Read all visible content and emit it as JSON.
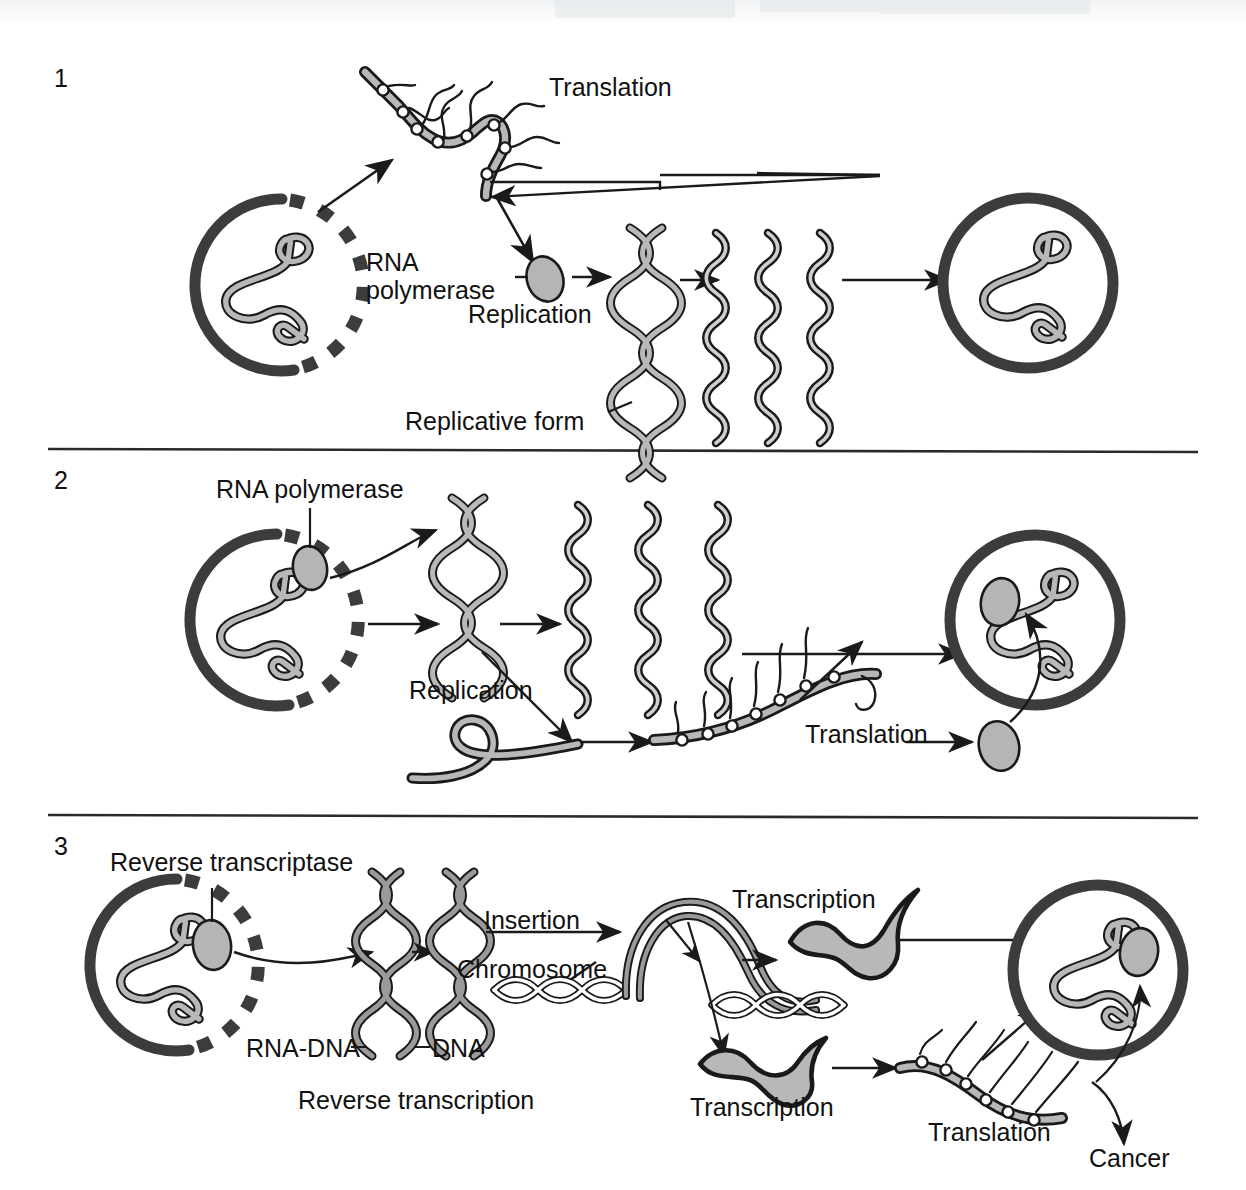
{
  "figure": {
    "type": "biology-diagram",
    "background_color": "#ffffff",
    "ink_color": "#1a1a1a",
    "strand_fill": "#b8b8b8",
    "capsid_color": "#3c3c3c",
    "enzyme_fill": "#b5b5b5"
  },
  "panels": [
    {
      "number": "1",
      "name": "positive-sense-rna-virus",
      "labels": [
        {
          "id": "p1-translation",
          "text": "Translation"
        },
        {
          "id": "p1-rna-pol-line1",
          "text": "RNA"
        },
        {
          "id": "p1-rna-pol-line2",
          "text": "polymerase"
        },
        {
          "id": "p1-replication",
          "text": "Replication"
        },
        {
          "id": "p1-replicative",
          "text": "Replicative form"
        }
      ],
      "elements": [
        "virion-left",
        "polysome",
        "rna-polymerase-enzyme",
        "replicative-form-duplex",
        "progeny-rna-strands",
        "virion-right"
      ]
    },
    {
      "number": "2",
      "name": "negative-sense-rna-virus",
      "labels": [
        {
          "id": "p2-rna-pol",
          "text": "RNA polymerase"
        },
        {
          "id": "p2-replication",
          "text": "Replication"
        },
        {
          "id": "p2-translation",
          "text": "Translation"
        }
      ],
      "elements": [
        "virion-left",
        "packaged-polymerase",
        "replicative-form-duplex",
        "progeny-rna-strands",
        "mrna-loop",
        "polysome",
        "virion-right",
        "free-polymerase"
      ]
    },
    {
      "number": "3",
      "name": "retrovirus",
      "labels": [
        {
          "id": "p3-revtrans-enzyme",
          "text": "Reverse transcriptase"
        },
        {
          "id": "p3-insertion",
          "text": "Insertion"
        },
        {
          "id": "p3-chromosome",
          "text": "Chromosome"
        },
        {
          "id": "p3-rna-dna",
          "text": "RNA-DNA"
        },
        {
          "id": "p3-dna",
          "text": "DNA"
        },
        {
          "id": "p3-rev-transcription",
          "text": "Reverse transcription"
        },
        {
          "id": "p3-transcription-up",
          "text": "Transcription"
        },
        {
          "id": "p3-transcription-dn",
          "text": "Transcription"
        },
        {
          "id": "p3-translation",
          "text": "Translation"
        },
        {
          "id": "p3-cancer",
          "text": "Cancer"
        }
      ],
      "elements": [
        "virion-left",
        "reverse-transcriptase-enzyme",
        "rna-dna-hybrid-duplex",
        "dna-duplex",
        "host-chromosome",
        "integrated-provirus",
        "genomic-rna",
        "mrna",
        "polysome",
        "virion-right",
        "cancer-outcome"
      ]
    }
  ],
  "dividers": [
    {
      "id": "divider-1-2",
      "y": 449
    },
    {
      "id": "divider-2-3",
      "y": 815
    }
  ]
}
